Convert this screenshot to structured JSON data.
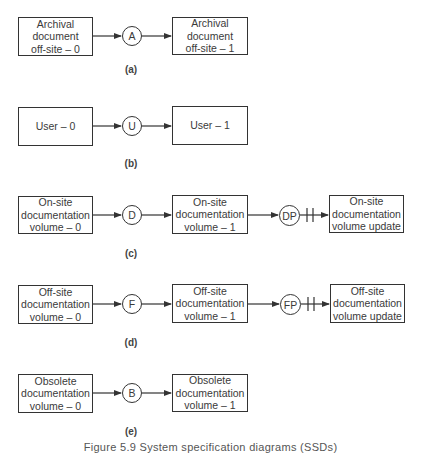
{
  "diagram": {
    "caption": "Figure 5.9 System specification diagrams (SSDs)",
    "line_color": "#333333",
    "rows": [
      {
        "id": "a",
        "label": "(a)",
        "boxes": [
          {
            "text": "Archival\ndocument\noff-site – 0"
          },
          {
            "text": "Archival\ndocument\noff-site – 1"
          }
        ],
        "nodes": [
          {
            "text": "A"
          }
        ]
      },
      {
        "id": "b",
        "label": "(b)",
        "boxes": [
          {
            "text": "User – 0"
          },
          {
            "text": "User – 1"
          }
        ],
        "nodes": [
          {
            "text": "U"
          }
        ]
      },
      {
        "id": "c",
        "label": "(c)",
        "boxes": [
          {
            "text": "On-site\ndocumentation\nvolume – 0"
          },
          {
            "text": "On-site\ndocumentation\nvolume – 1"
          },
          {
            "text": "On-site\ndocumentation\nvolume update"
          }
        ],
        "nodes": [
          {
            "text": "D"
          },
          {
            "text": "DP"
          }
        ],
        "rough_merge": true
      },
      {
        "id": "d",
        "label": "(d)",
        "boxes": [
          {
            "text": "Off-site\ndocumentation\nvolume – 0"
          },
          {
            "text": "Off-site\ndocumentation\nvolume – 1"
          },
          {
            "text": "Off-site\ndocumentation\nvolume update"
          }
        ],
        "nodes": [
          {
            "text": "F"
          },
          {
            "text": "FP"
          }
        ],
        "rough_merge": true
      },
      {
        "id": "e",
        "label": "(e)",
        "boxes": [
          {
            "text": "Obsolete\ndocumentation\nvolume – 0"
          },
          {
            "text": "Obsolete\ndocumentation\nvolume – 1"
          }
        ],
        "nodes": [
          {
            "text": "B"
          }
        ]
      }
    ]
  }
}
